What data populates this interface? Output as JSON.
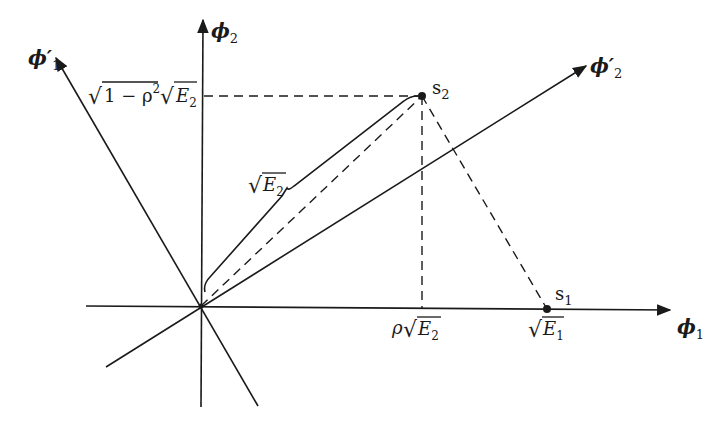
{
  "diagram": {
    "axes": {
      "phi1": {
        "label": "ϕ",
        "sub": "1"
      },
      "phi2": {
        "label": "ϕ",
        "sub": "2"
      },
      "phi1_prime": {
        "label": "ϕ′",
        "sub": "1"
      },
      "phi2_prime": {
        "label": "ϕ′",
        "sub": "2"
      }
    },
    "points": {
      "s1": {
        "label": "s",
        "sub": "1"
      },
      "s2": {
        "label": "s",
        "sub": "2"
      }
    },
    "annotations": {
      "y_projection": {
        "prefix": "√",
        "radicand1": "1 − ρ",
        "sup": "2",
        "mid": "√",
        "var": "E",
        "sub": "2"
      },
      "x_projection": {
        "prefix": "ρ",
        "root": "√",
        "var": "E",
        "sub": "2"
      },
      "s1_position": {
        "root": "√",
        "var": "E",
        "sub": "1"
      },
      "brace_length": {
        "root": "√",
        "var": "E",
        "sub": "2"
      }
    },
    "colors": {
      "ink": "#1a1a1a",
      "background": "#ffffff"
    }
  }
}
